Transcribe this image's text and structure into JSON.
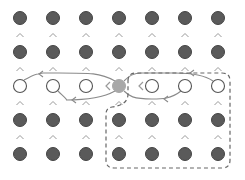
{
  "diagram": {
    "title": "",
    "grid": {
      "rows": 5,
      "cols": 7,
      "cell_states": [
        [
          "filled",
          "filled",
          "filled",
          "filled",
          "filled",
          "filled",
          "filled"
        ],
        [
          "filled",
          "filled",
          "filled",
          "filled",
          "filled",
          "filled",
          "filled"
        ],
        [
          "empty",
          "empty",
          "empty",
          "current",
          "empty",
          "empty",
          "empty"
        ],
        [
          "filled",
          "filled",
          "filled",
          "filled",
          "filled",
          "filled",
          "filled"
        ],
        [
          "filled",
          "filled",
          "filled",
          "filled",
          "filled",
          "filled",
          "filled"
        ]
      ],
      "vertical_connector_glyph": "^",
      "horizontal_connector_glyph": "<"
    },
    "colors": {
      "filled": "#5a5a5a",
      "filled_stroke": "#444444",
      "current": "#a8a8a8",
      "empty_fill": "#ffffff",
      "empty_stroke": "#555555",
      "connector": "#9a9a9a",
      "path": "#8a8a8a",
      "dashed_region": "#666666"
    },
    "paths": [
      {
        "name": "left-outer-loop",
        "from": [
          2,
          3
        ],
        "to": [
          2,
          0
        ]
      },
      {
        "name": "left-inner-loop",
        "from": [
          2,
          3
        ],
        "to": [
          2,
          1
        ]
      },
      {
        "name": "right-outer-loop",
        "from": [
          2,
          6
        ],
        "to": [
          2,
          3
        ]
      },
      {
        "name": "right-inner-loop",
        "from": [
          2,
          5
        ],
        "to": [
          2,
          3
        ]
      }
    ],
    "dashed_region": {
      "description": "region covering right side of middle row and lower-right block",
      "covers_cols": [
        3,
        6
      ],
      "covers_rows": [
        2,
        4
      ]
    }
  }
}
